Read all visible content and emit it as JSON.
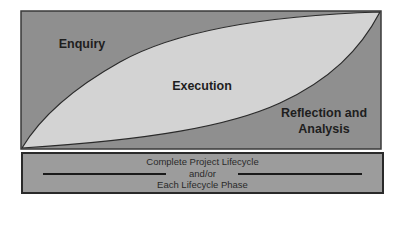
{
  "diagram": {
    "regions": [
      {
        "id": "enquiry",
        "label": "Enquiry",
        "color": "#8f8f8f"
      },
      {
        "id": "execution",
        "label": "Execution",
        "color": "#d3d3d3"
      },
      {
        "id": "reflection",
        "label_line1": "Reflection and",
        "label_line2": "Analysis",
        "color": "#8f8f8f"
      }
    ],
    "frame_color": "#3a3a3a",
    "curve_color": "#2a2a2a"
  },
  "footer_box": {
    "line1": "Complete Project Lifecycle",
    "line2": "and/or",
    "line3": "Each Lifecycle Phase",
    "color": "#9c9c9c"
  }
}
